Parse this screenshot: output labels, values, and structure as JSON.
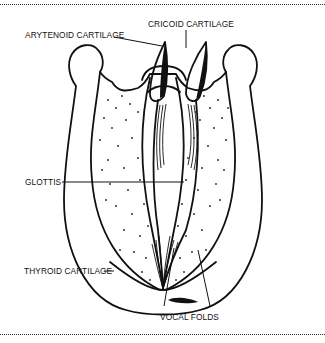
{
  "figure": {
    "labels": {
      "cricoid": "CRICOID CARTILAGE",
      "arytenoid": "ARYTENOID CARTILAGE",
      "glottis": "GLOTTIS",
      "thyroid": "THYROID CARTILAGE",
      "vocal_folds": "VOCAL FOLDS"
    },
    "colors": {
      "ink": "#111111",
      "background": "#ffffff"
    }
  }
}
